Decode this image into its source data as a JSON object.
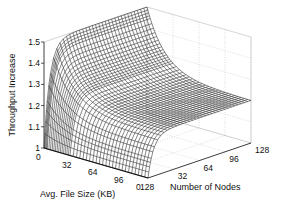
{
  "chart_data": {
    "type": "surface",
    "title": "",
    "xlabel": "Avg. File Size (KB)",
    "ylabel": "Number of Nodes",
    "zlabel": "Throughput Increase",
    "x_ticks": [
      "0",
      "32",
      "64",
      "96",
      "128"
    ],
    "y_ticks": [
      "0",
      "32",
      "64",
      "96",
      "128"
    ],
    "z_ticks": [
      "1",
      "1.1",
      "1.2",
      "1.3",
      "1.4",
      "1.5"
    ],
    "xlim": [
      0,
      128
    ],
    "ylim": [
      0,
      128
    ],
    "zlim": [
      1,
      1.5
    ],
    "grid": true,
    "sample_points": [
      {
        "file_size": 0,
        "nodes": 0,
        "z": 1.0
      },
      {
        "file_size": 0,
        "nodes": 8,
        "z": 1.38
      },
      {
        "file_size": 0,
        "nodes": 128,
        "z": 1.5
      },
      {
        "file_size": 32,
        "nodes": 128,
        "z": 1.3
      },
      {
        "file_size": 64,
        "nodes": 128,
        "z": 1.24
      },
      {
        "file_size": 128,
        "nodes": 128,
        "z": 1.2
      },
      {
        "file_size": 128,
        "nodes": 0,
        "z": 1.0
      }
    ],
    "model": {
      "zmax_gain": 0.5,
      "node_scale": 7,
      "file_floor": 0.4,
      "file_scale": 22
    }
  }
}
